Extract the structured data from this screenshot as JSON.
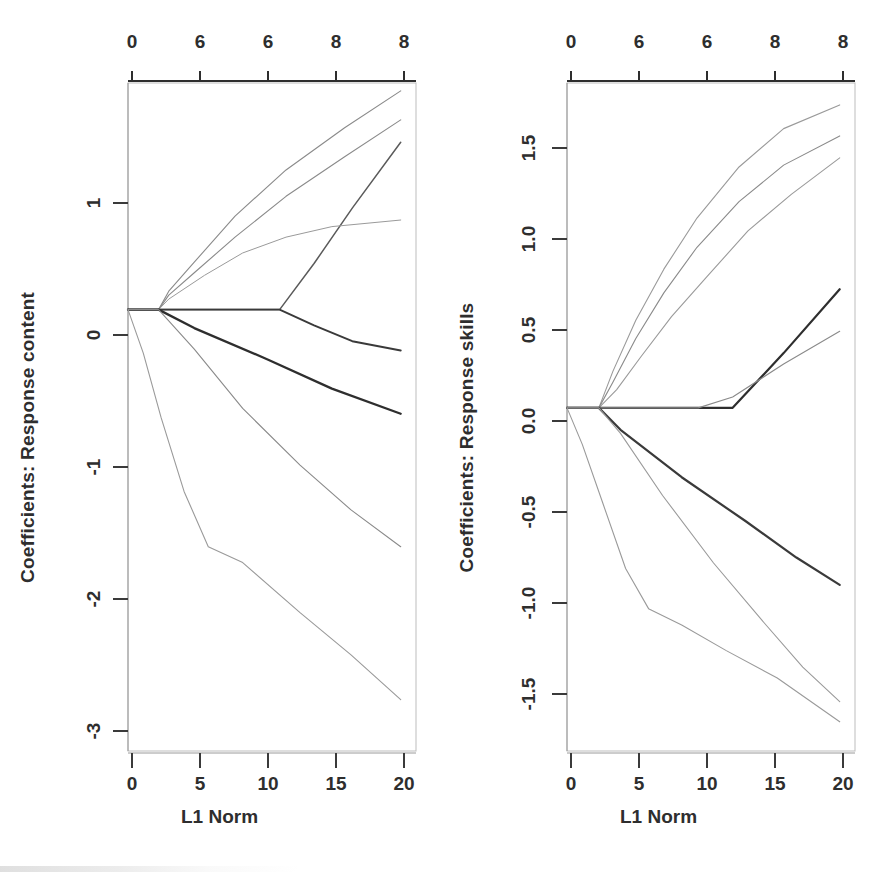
{
  "figure": {
    "type": "lasso-coefficient-path-figure",
    "background_color": "#ffffff",
    "panel_count": 2
  },
  "panels": [
    {
      "id": "left",
      "ylabel": "Coefficients: Response content",
      "xlabel": "L1 Norm"
    },
    {
      "id": "right",
      "ylabel": "Coefficients: Response skills",
      "xlabel": "L1 Norm"
    }
  ],
  "chart_data": [
    {
      "type": "line",
      "title": "",
      "subtitle": "",
      "xlabel": "L1 Norm",
      "ylabel": "Coefficients: Response content",
      "xlim": [
        0,
        22.6
      ],
      "ylim": [
        -3.35,
        1.72
      ],
      "grid": false,
      "legend": null,
      "x_ticks": [
        0,
        5,
        10,
        15,
        20
      ],
      "x_tick_labels": [
        "0",
        "5",
        "10",
        "15",
        "20"
      ],
      "y_ticks": [
        1,
        0,
        -1,
        -2,
        -3
      ],
      "y_tick_labels": [
        "1",
        "0",
        "-1",
        "-2",
        "-3"
      ],
      "top_axis_ticks": [
        0,
        5,
        10,
        15,
        20
      ],
      "top_axis_tick_labels": [
        "0",
        "6",
        "6",
        "8",
        "8"
      ],
      "top_axis_caption": "degrees of freedom",
      "series": [
        {
          "name": "path-1",
          "color": "#8a8a8a",
          "width": 1.1,
          "x": [
            0,
            2.4,
            3.2,
            5.2,
            8.4,
            12.4,
            17.0,
            21.4
          ],
          "y": [
            0,
            0,
            0.14,
            0.36,
            0.71,
            1.06,
            1.38,
            1.66
          ]
        },
        {
          "name": "path-2",
          "color": "#8a8a8a",
          "width": 1.1,
          "x": [
            0,
            2.4,
            3.2,
            5.2,
            8.4,
            12.4,
            17.0,
            21.4
          ],
          "y": [
            0,
            0,
            0.11,
            0.28,
            0.55,
            0.86,
            1.16,
            1.44
          ]
        },
        {
          "name": "path-3",
          "color": "#5a5a5a",
          "width": 1.5,
          "x": [
            0,
            2.4,
            8.4,
            11.9,
            14.6,
            17.6,
            21.4
          ],
          "y": [
            0,
            0,
            0,
            0,
            0.35,
            0.77,
            1.27
          ]
        },
        {
          "name": "path-4",
          "color": "#9a9a9a",
          "width": 1.0,
          "x": [
            0,
            2.4,
            3.2,
            6.0,
            9.0,
            12.4,
            16.0,
            21.4
          ],
          "y": [
            0,
            0,
            0.08,
            0.26,
            0.43,
            0.55,
            0.63,
            0.68
          ]
        },
        {
          "name": "path-5",
          "color": "#3a3a3a",
          "width": 1.9,
          "x": [
            0,
            2.4,
            11.9,
            14.6,
            17.6,
            21.4
          ],
          "y": [
            0,
            0,
            0,
            -0.12,
            -0.24,
            -0.31
          ]
        },
        {
          "name": "path-6",
          "color": "#2e2e2e",
          "width": 2.3,
          "x": [
            0,
            2.4,
            5.2,
            11.0,
            16.0,
            21.4
          ],
          "y": [
            0,
            0,
            -0.14,
            -0.38,
            -0.6,
            -0.79
          ]
        },
        {
          "name": "path-7",
          "color": "#8a8a8a",
          "width": 1.1,
          "x": [
            0,
            2.4,
            5.2,
            9.0,
            13.5,
            17.5,
            21.4
          ],
          "y": [
            0,
            0,
            -0.3,
            -0.75,
            -1.18,
            -1.52,
            -1.8
          ]
        },
        {
          "name": "path-8",
          "color": "#9a9a9a",
          "width": 1.1,
          "x": [
            0,
            1.2,
            2.6,
            4.4,
            6.3,
            9.0,
            13.5,
            17.5,
            21.4
          ],
          "y": [
            0,
            -0.33,
            -0.82,
            -1.38,
            -1.8,
            -1.92,
            -2.3,
            -2.62,
            -2.96
          ]
        }
      ]
    },
    {
      "type": "line",
      "title": "",
      "subtitle": "",
      "xlabel": "L1 Norm",
      "ylabel": "Coefficients: Response skills",
      "xlim": [
        0,
        22.6
      ],
      "ylim": [
        -1.88,
        1.78
      ],
      "grid": false,
      "legend": null,
      "x_ticks": [
        0,
        5,
        10,
        15,
        20
      ],
      "x_tick_labels": [
        "0",
        "5",
        "10",
        "15",
        "20"
      ],
      "y_ticks": [
        1.5,
        1.0,
        0.5,
        0.0,
        -0.5,
        -1.0,
        -1.5
      ],
      "y_tick_labels": [
        "1.5",
        "1.0",
        "0.5",
        "0.0",
        "-0.5",
        "-1.0",
        "-1.5"
      ],
      "top_axis_ticks": [
        0,
        5,
        10,
        15,
        20
      ],
      "top_axis_tick_labels": [
        "0",
        "6",
        "6",
        "8",
        "8"
      ],
      "top_axis_caption": "degrees of freedom",
      "series": [
        {
          "name": "path-1",
          "color": "#9a9a9a",
          "width": 1.1,
          "x": [
            0,
            2.5,
            3.6,
            5.4,
            7.6,
            10.2,
            13.5,
            17.0,
            21.4
          ],
          "y": [
            0,
            0,
            0.2,
            0.48,
            0.76,
            1.04,
            1.32,
            1.53,
            1.66
          ]
        },
        {
          "name": "path-2",
          "color": "#8a8a8a",
          "width": 1.1,
          "x": [
            0,
            2.5,
            3.6,
            5.4,
            7.6,
            10.2,
            13.5,
            17.0,
            21.4
          ],
          "y": [
            0,
            0,
            0.14,
            0.38,
            0.63,
            0.88,
            1.13,
            1.33,
            1.49
          ]
        },
        {
          "name": "path-3",
          "color": "#9a9a9a",
          "width": 1.1,
          "x": [
            0,
            2.5,
            3.9,
            5.8,
            8.2,
            11.0,
            14.2,
            17.6,
            21.4
          ],
          "y": [
            0,
            0,
            0.1,
            0.28,
            0.5,
            0.72,
            0.97,
            1.17,
            1.37
          ]
        },
        {
          "name": "path-4",
          "color": "#2e2e2e",
          "width": 2.2,
          "x": [
            0,
            2.5,
            11.6,
            13.0,
            17.0,
            21.4
          ],
          "y": [
            0,
            0,
            0,
            0,
            0.3,
            0.65
          ]
        },
        {
          "name": "path-5",
          "color": "#8a8a8a",
          "width": 1.1,
          "x": [
            0,
            2.5,
            10.3,
            13.0,
            17.0,
            21.4
          ],
          "y": [
            0,
            0,
            0,
            0.06,
            0.24,
            0.42
          ]
        },
        {
          "name": "path-6",
          "color": "#3a3a3a",
          "width": 2.2,
          "x": [
            0,
            2.5,
            4.2,
            9.0,
            14.0,
            18.0,
            21.4
          ],
          "y": [
            0,
            0,
            -0.12,
            -0.38,
            -0.62,
            -0.82,
            -0.97
          ]
        },
        {
          "name": "path-7",
          "color": "#9a9a9a",
          "width": 1.1,
          "x": [
            0,
            2.5,
            4.2,
            7.5,
            11.5,
            15.5,
            18.5,
            21.4
          ],
          "y": [
            0,
            0,
            -0.14,
            -0.48,
            -0.85,
            -1.18,
            -1.42,
            -1.61
          ]
        },
        {
          "name": "path-8",
          "color": "#9a9a9a",
          "width": 1.1,
          "x": [
            0,
            1.2,
            2.8,
            4.6,
            6.4,
            9.0,
            12.5,
            16.5,
            21.4
          ],
          "y": [
            0,
            -0.2,
            -0.52,
            -0.88,
            -1.1,
            -1.19,
            -1.33,
            -1.48,
            -1.72
          ]
        }
      ]
    }
  ]
}
